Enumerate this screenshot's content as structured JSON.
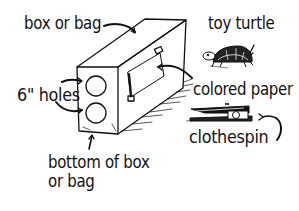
{
  "diagram": {
    "labels": {
      "box_or_bag": "box or bag",
      "toy_turtle": "toy turtle",
      "six_inch_holes": "6\" holes",
      "colored_paper": "colored paper",
      "clothespin": "clothespin",
      "bottom_line1": "bottom of box",
      "bottom_line2": "or bag"
    },
    "colors": {
      "ink": "#111111",
      "background": "#ffffff"
    }
  }
}
